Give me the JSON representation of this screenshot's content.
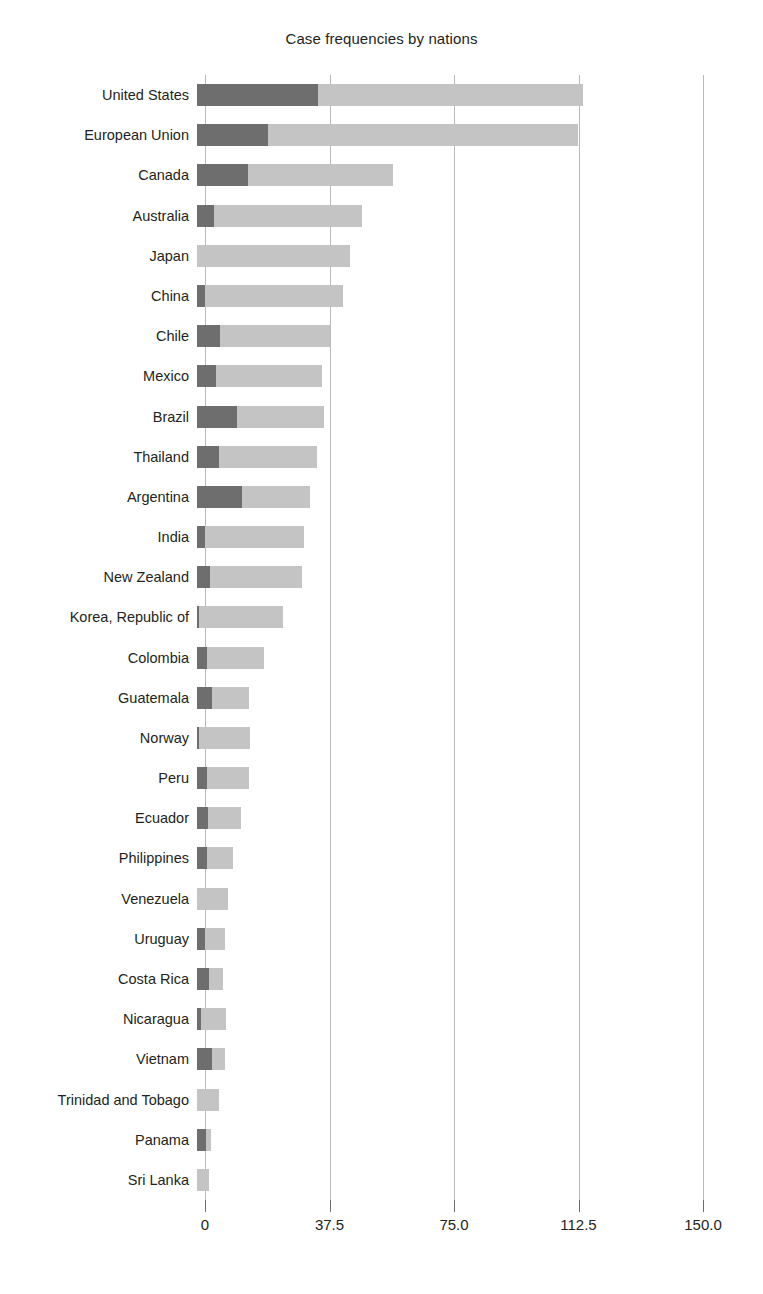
{
  "chart": {
    "title": "Case frequencies by nations",
    "colors": {
      "series_1": "#6e6e6e",
      "series_2": "#c4c4c4",
      "gridline": "#b9b9b9",
      "text": "#231f20",
      "background": "#ffffff"
    }
  },
  "chart_data": {
    "type": "bar",
    "title": "Case frequencies by nations",
    "orientation": "horizontal",
    "stacked": true,
    "xlabel": "",
    "ylabel": "",
    "xlim": [
      0,
      150
    ],
    "xticks": [
      0,
      37.5,
      75,
      112.5,
      150
    ],
    "xtick_labels": [
      "0",
      "37.5",
      "75.0",
      "112.5",
      "150.0"
    ],
    "grid": true,
    "grid_axis": "x",
    "legend": "none",
    "categories": [
      "United States",
      "European Union",
      "Canada",
      "Australia",
      "Japan",
      "China",
      "Chile",
      "Mexico",
      "Brazil",
      "Thailand",
      "Argentina",
      "India",
      "New Zealand",
      "Korea, Republic of",
      "Colombia",
      "Guatemala",
      "Norway",
      "Peru",
      "Ecuador",
      "Philippines",
      "Venezuela",
      "Uruguay",
      "Costa Rica",
      "Nicaragua",
      "Vietnam",
      "Trinidad and Tobago",
      "Panama",
      "Sri Lanka"
    ],
    "series": [
      {
        "name": "Series 1",
        "color": "#6e6e6e",
        "values": [
          36.5,
          21.5,
          15.4,
          5.1,
          0.0,
          2.4,
          6.9,
          5.7,
          12.0,
          6.6,
          13.6,
          2.4,
          3.9,
          0.6,
          3.0,
          4.5,
          0.6,
          3.0,
          3.3,
          3.0,
          0.0,
          2.4,
          3.6,
          1.2,
          4.5,
          0.0,
          2.7,
          0.0
        ]
      },
      {
        "name": "Series 2",
        "color": "#c4c4c4",
        "values": [
          79.8,
          93.3,
          43.7,
          44.7,
          46.1,
          41.6,
          33.3,
          32.0,
          26.4,
          29.4,
          20.4,
          29.8,
          27.6,
          25.4,
          17.3,
          11.1,
          15.4,
          12.6,
          9.9,
          7.8,
          9.3,
          6.0,
          4.2,
          7.4,
          3.8,
          6.6,
          1.6,
          3.6
        ]
      }
    ],
    "totals": [
      116.3,
      114.8,
      59.1,
      49.8,
      46.1,
      44.0,
      40.2,
      37.7,
      38.4,
      36.0,
      34.0,
      32.2,
      31.5,
      26.0,
      20.3,
      15.6,
      16.0,
      15.6,
      13.2,
      10.8,
      9.3,
      8.4,
      7.8,
      8.6,
      8.3,
      6.6,
      4.3,
      3.6
    ]
  }
}
